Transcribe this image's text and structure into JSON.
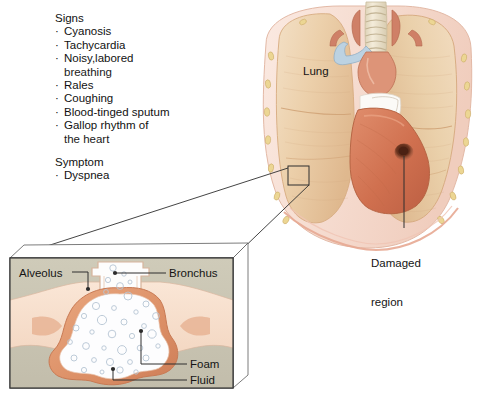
{
  "figure": {
    "background": "#ffffff"
  },
  "clinical_list": {
    "signs_heading": "Signs",
    "signs": [
      {
        "text": "Cyanosis"
      },
      {
        "text": "Tachycardia"
      },
      {
        "text": "Noisy,labored",
        "cont": "breathing"
      },
      {
        "text": "Rales"
      },
      {
        "text": "Coughing"
      },
      {
        "text": "Blood-tinged sputum"
      },
      {
        "text": "Gallop rhythm of",
        "cont": "the heart"
      }
    ],
    "symptom_heading": "Symptom",
    "symptoms": [
      {
        "text": "Dyspnea"
      }
    ],
    "bullet_glyph": "·"
  },
  "anatomy_labels": {
    "lung": "Lung",
    "damaged_region_line1": "Damaged",
    "damaged_region_line2": "region"
  },
  "detail_panel": {
    "alveolus": "Alveolus",
    "bronchus": "Bronchus",
    "foam": "Foam",
    "fluid": "Fluid"
  },
  "colors": {
    "lung_tissue": "#e9c9a2",
    "lung_tissue_light": "#f2ddc0",
    "lung_shadow": "#d9ae81",
    "ribcage": "#f7d9cd",
    "rib_oval": "#e8d28a",
    "heart": "#d4775a",
    "heart_light": "#e39a7b",
    "damaged_spot": "#5e2d1c",
    "trachea": "#efe6cf",
    "vessel": "#cf7f62",
    "vessel_blue": "#b9cfe0",
    "panel_olive": "#c8c4b2",
    "panel_peach": "#f6ddc9",
    "alveolus_wall": "#e09a74",
    "alveolus_lumen": "#fdfdfd",
    "bubble_stroke": "#b9c6d4",
    "leader_line": "#3a3a3a",
    "text": "#141414"
  },
  "icons": {
    "lung_callout_box": "callout-rect-icon",
    "pointer_dot": "leader-dot-icon"
  }
}
